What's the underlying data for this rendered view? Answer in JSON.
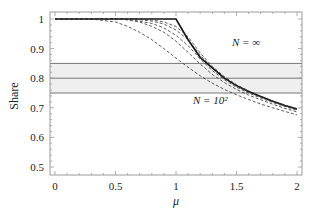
{
  "chart_data": {
    "type": "line",
    "title": "",
    "xlabel": "μ",
    "ylabel": "Share",
    "xlim": [
      -0.05,
      2.05
    ],
    "ylim": [
      0.47,
      1.025
    ],
    "grid": false,
    "legend": null,
    "x_ticks": [
      "0",
      "0.5",
      "1",
      "1.5",
      "2"
    ],
    "x_tick_values": [
      0,
      0.5,
      1,
      1.5,
      2
    ],
    "y_ticks": [
      "0.5",
      "0.6",
      "0.7",
      "0.8",
      "0.9",
      "1"
    ],
    "y_tick_values": [
      0.5,
      0.6,
      0.7,
      0.8,
      0.9,
      1.0
    ],
    "band": {
      "lower": 0.75,
      "center": 0.8,
      "upper": 0.85,
      "fill": "#efefef",
      "line_color": "#777777"
    },
    "annotations": [
      {
        "text": "N = ∞",
        "x": 1.55,
        "y": 0.93
      },
      {
        "text": "N = 10²",
        "x": 1.35,
        "y": 0.72
      }
    ],
    "series": [
      {
        "name": "N = ∞",
        "style": "solid",
        "x": [
          0,
          0.5,
          1.0,
          1.1,
          1.2,
          1.3,
          1.4,
          1.5,
          1.6,
          1.7,
          1.8,
          1.9,
          2.0
        ],
        "values": [
          1.0,
          1.0,
          1.0,
          0.93,
          0.87,
          0.835,
          0.8,
          0.775,
          0.755,
          0.738,
          0.722,
          0.708,
          0.696
        ]
      },
      {
        "name": "N = 10^6",
        "style": "dashed",
        "x": [
          0,
          0.7,
          0.8,
          0.9,
          1.0,
          1.1,
          1.2,
          1.3,
          1.4,
          1.5,
          1.6,
          1.7,
          1.8,
          1.9,
          2.0
        ],
        "values": [
          1.0,
          1.0,
          0.997,
          0.99,
          0.975,
          0.94,
          0.885,
          0.84,
          0.805,
          0.778,
          0.757,
          0.739,
          0.723,
          0.709,
          0.697
        ]
      },
      {
        "name": "N = 10^5",
        "style": "dashed",
        "x": [
          0,
          0.65,
          0.8,
          0.9,
          1.0,
          1.1,
          1.2,
          1.3,
          1.4,
          1.5,
          1.6,
          1.7,
          1.8,
          1.9,
          2.0
        ],
        "values": [
          1.0,
          1.0,
          0.993,
          0.983,
          0.963,
          0.93,
          0.878,
          0.835,
          0.801,
          0.775,
          0.754,
          0.737,
          0.721,
          0.707,
          0.695
        ]
      },
      {
        "name": "N = 10^4",
        "style": "dashed",
        "x": [
          0,
          0.6,
          0.8,
          0.9,
          1.0,
          1.1,
          1.2,
          1.3,
          1.4,
          1.5,
          1.6,
          1.7,
          1.8,
          1.9,
          2.0
        ],
        "values": [
          1.0,
          1.0,
          0.985,
          0.97,
          0.945,
          0.91,
          0.865,
          0.826,
          0.795,
          0.77,
          0.75,
          0.733,
          0.718,
          0.704,
          0.692
        ]
      },
      {
        "name": "N = 10^3",
        "style": "dashed",
        "x": [
          0,
          0.55,
          0.7,
          0.8,
          0.9,
          1.0,
          1.1,
          1.2,
          1.3,
          1.4,
          1.5,
          1.6,
          1.7,
          1.8,
          1.9,
          2.0
        ],
        "values": [
          1.0,
          1.0,
          0.99,
          0.975,
          0.955,
          0.925,
          0.887,
          0.848,
          0.813,
          0.785,
          0.762,
          0.743,
          0.727,
          0.712,
          0.698,
          0.686
        ]
      },
      {
        "name": "N = 10^2",
        "style": "dashed",
        "x": [
          0,
          0.3,
          0.5,
          0.6,
          0.7,
          0.8,
          0.9,
          1.0,
          1.1,
          1.2,
          1.3,
          1.4,
          1.5,
          1.6,
          1.7,
          1.8,
          1.9,
          2.0
        ],
        "values": [
          1.0,
          1.0,
          0.99,
          0.975,
          0.955,
          0.93,
          0.9,
          0.868,
          0.837,
          0.808,
          0.783,
          0.762,
          0.744,
          0.728,
          0.713,
          0.7,
          0.688,
          0.676
        ]
      }
    ]
  }
}
